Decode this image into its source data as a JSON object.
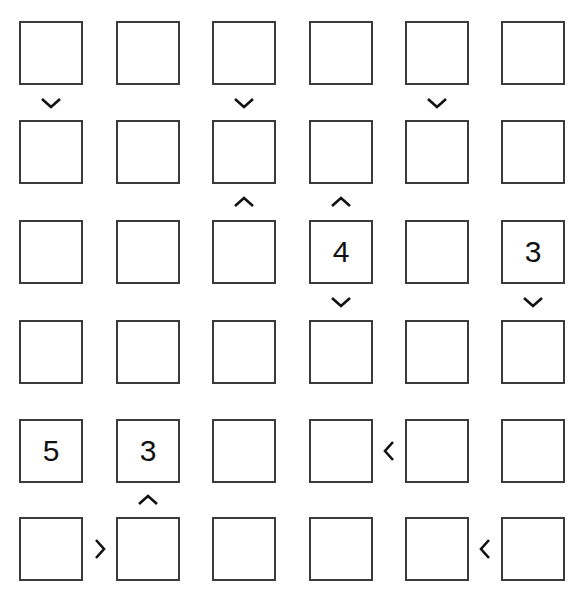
{
  "puzzle": {
    "type": "futoshiki",
    "size": 6,
    "grid": [
      [
        "",
        "",
        "",
        "",
        "",
        ""
      ],
      [
        "",
        "",
        "",
        "",
        "",
        ""
      ],
      [
        "",
        "",
        "",
        "4",
        "",
        "3"
      ],
      [
        "",
        "",
        "",
        "",
        "",
        ""
      ],
      [
        "5",
        "3",
        "",
        "",
        "",
        ""
      ],
      [
        "",
        "",
        "",
        "",
        "",
        ""
      ]
    ],
    "vertical_signs": [
      {
        "row": 0,
        "col": 0,
        "glyph": "v",
        "meaning": "top > bottom"
      },
      {
        "row": 0,
        "col": 2,
        "glyph": "v",
        "meaning": "top > bottom"
      },
      {
        "row": 0,
        "col": 4,
        "glyph": "v",
        "meaning": "top > bottom"
      },
      {
        "row": 1,
        "col": 2,
        "glyph": "^",
        "meaning": "top < bottom"
      },
      {
        "row": 1,
        "col": 3,
        "glyph": "^",
        "meaning": "top < bottom"
      },
      {
        "row": 2,
        "col": 3,
        "glyph": "v",
        "meaning": "top > bottom"
      },
      {
        "row": 2,
        "col": 5,
        "glyph": "v",
        "meaning": "top > bottom"
      },
      {
        "row": 4,
        "col": 1,
        "glyph": "^",
        "meaning": "top < bottom"
      }
    ],
    "horizontal_signs": [
      {
        "row": 4,
        "col": 3,
        "glyph": "<",
        "meaning": "left < right"
      },
      {
        "row": 5,
        "col": 0,
        "glyph": ">",
        "meaning": "left > right"
      },
      {
        "row": 5,
        "col": 4,
        "glyph": "<",
        "meaning": "left < right"
      }
    ]
  },
  "colors": {
    "border": "#3a3a3a",
    "text": "#111111",
    "sign": "#111111",
    "background": "#ffffff"
  }
}
